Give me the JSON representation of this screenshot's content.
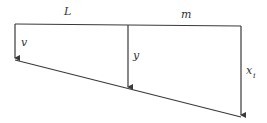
{
  "diagram": {
    "labels": {
      "top_left_segment": "L",
      "top_right_segment": "m",
      "left_arrow": "v",
      "middle_arrow": "y",
      "right_arrow": "x",
      "right_arrow_subscript": "i"
    },
    "colors": {
      "line": "#3a3a3a",
      "background": "#ffffff"
    }
  }
}
